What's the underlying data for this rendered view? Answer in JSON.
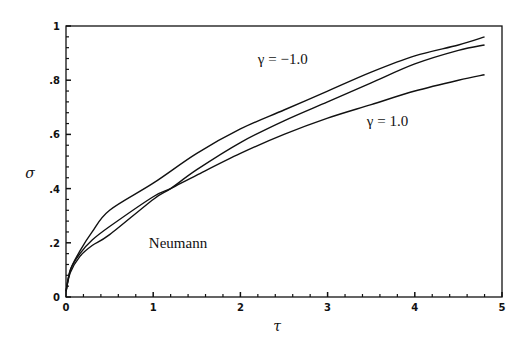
{
  "chart_data": {
    "type": "line",
    "title": "",
    "xlabel": "τ",
    "ylabel": "σ",
    "xlim": [
      0,
      5
    ],
    "ylim": [
      0,
      1
    ],
    "grid": false,
    "legend": "none (inline annotations)",
    "x_ticks": [
      0,
      1,
      2,
      3,
      4,
      5
    ],
    "x_tick_labels": [
      "0",
      "1",
      "2",
      "3",
      "4",
      "5"
    ],
    "y_ticks": [
      0,
      0.2,
      0.4,
      0.6,
      0.8,
      1
    ],
    "y_tick_labels": [
      "0",
      ".2",
      ".4",
      ".6",
      ".8",
      "1"
    ],
    "series": [
      {
        "name": "γ = −1.0",
        "x": [
          0,
          0.05,
          0.16,
          0.3,
          0.5,
          1.0,
          1.5,
          2.0,
          2.5,
          3.0,
          3.5,
          4.0,
          4.5,
          4.8
        ],
        "values": [
          0.02,
          0.1,
          0.17,
          0.24,
          0.32,
          0.42,
          0.53,
          0.62,
          0.69,
          0.76,
          0.83,
          0.89,
          0.93,
          0.96
        ]
      },
      {
        "name": "Neumann",
        "x": [
          0,
          0.05,
          0.16,
          0.3,
          0.5,
          1.0,
          1.2,
          1.5,
          2.0,
          2.5,
          3.0,
          3.5,
          4.0,
          4.5,
          4.8
        ],
        "values": [
          0.02,
          0.09,
          0.15,
          0.19,
          0.23,
          0.36,
          0.4,
          0.47,
          0.57,
          0.65,
          0.72,
          0.79,
          0.86,
          0.91,
          0.93
        ]
      },
      {
        "name": "γ = 1.0",
        "x": [
          0,
          0.05,
          0.16,
          0.3,
          0.5,
          1.0,
          1.2,
          1.5,
          2.0,
          2.5,
          3.0,
          3.5,
          4.0,
          4.5,
          4.8
        ],
        "values": [
          0.02,
          0.1,
          0.16,
          0.21,
          0.26,
          0.37,
          0.4,
          0.45,
          0.53,
          0.6,
          0.66,
          0.71,
          0.76,
          0.8,
          0.82
        ]
      }
    ],
    "annotations": [
      {
        "text": "γ = −1.0",
        "x": 2.2,
        "y": 0.86
      },
      {
        "text": "γ = 1.0",
        "x": 3.45,
        "y": 0.63
      },
      {
        "text": "Neumann",
        "x": 0.95,
        "y": 0.18
      }
    ]
  },
  "plot_area": {
    "left": 66,
    "top": 26,
    "right": 502,
    "bottom": 297
  },
  "colors": {
    "line": "#111111",
    "background": "#ffffff"
  }
}
